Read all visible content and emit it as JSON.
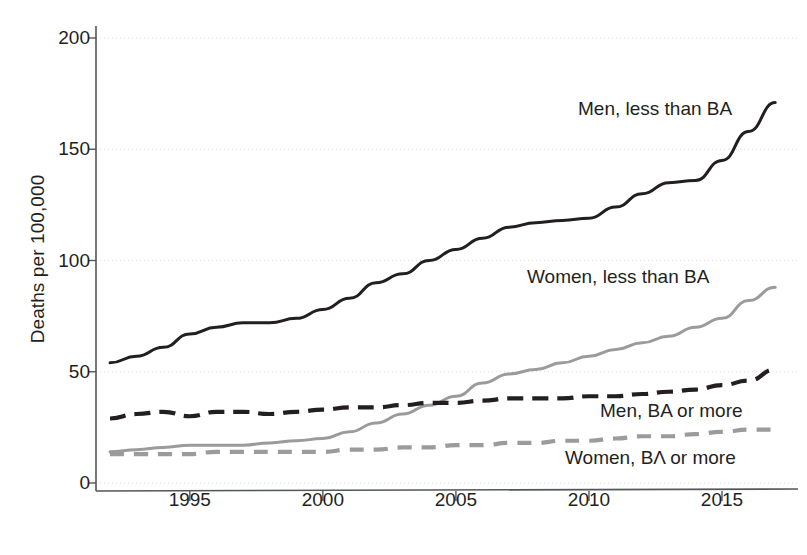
{
  "chart_data": {
    "type": "line",
    "title": "",
    "xlabel": "",
    "ylabel": "Deaths per 100,000",
    "xlim": [
      1992,
      2017
    ],
    "ylim": [
      0,
      200
    ],
    "xticks": [
      1995,
      2000,
      2005,
      2010,
      2015
    ],
    "yticks": [
      0,
      50,
      100,
      150,
      200
    ],
    "xtick_labels": [
      "1995",
      "2000",
      "2005",
      "2010",
      "2015"
    ],
    "ytick_labels": [
      "0",
      "50",
      "100",
      "150",
      "200"
    ],
    "grid": "horizontal-faint",
    "legend": "inline-annotations",
    "x": [
      1992,
      1993,
      1994,
      1995,
      1996,
      1997,
      1998,
      1999,
      2000,
      2001,
      2002,
      2003,
      2004,
      2005,
      2006,
      2007,
      2008,
      2009,
      2010,
      2011,
      2012,
      2013,
      2014,
      2015,
      2016,
      2017
    ],
    "series": [
      {
        "name": "Men, less than BA",
        "color": "#231f20",
        "style": "solid",
        "values": [
          54,
          57,
          61,
          67,
          70,
          72,
          72,
          74,
          78,
          83,
          90,
          94,
          100,
          105,
          110,
          115,
          117,
          118,
          119,
          124,
          130,
          135,
          136,
          145,
          158,
          171
        ]
      },
      {
        "name": "Women, less than BA",
        "color": "#9b9b9b",
        "style": "solid",
        "values": [
          14,
          15,
          16,
          17,
          17,
          17,
          18,
          19,
          20,
          23,
          27,
          31,
          35,
          39,
          45,
          49,
          51,
          54,
          57,
          60,
          63,
          66,
          70,
          74,
          82,
          88
        ]
      },
      {
        "name": "Men, BA or more",
        "color": "#231f20",
        "style": "dashed",
        "values": [
          29,
          31,
          32,
          30,
          32,
          32,
          31,
          32,
          33,
          34,
          34,
          35,
          36,
          36,
          37,
          38,
          38,
          38,
          39,
          39,
          40,
          41,
          42,
          44,
          46,
          51
        ]
      },
      {
        "name": "Women, BA or more",
        "color": "#9b9b9b",
        "style": "dashed",
        "values": [
          13,
          13,
          13,
          13,
          14,
          14,
          14,
          14,
          14,
          15,
          15,
          16,
          16,
          17,
          17,
          18,
          18,
          19,
          19,
          20,
          21,
          21,
          22,
          23,
          24,
          24
        ]
      }
    ]
  },
  "axes": {
    "y_title": "Deaths per 100,000"
  },
  "annotations": {
    "men_less_than_ba": "Men, less than BA",
    "women_less_than_ba": "Women, less than BA",
    "men_ba_or_more": "Men, BA or more",
    "women_ba_or_more": "Women, BΛ or more"
  }
}
